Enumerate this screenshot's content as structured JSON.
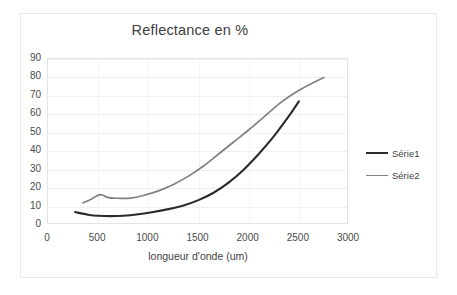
{
  "chart_data": {
    "type": "line",
    "title": "Reflectance en %",
    "xlabel": "longueur d'onde (um)",
    "ylabel": "",
    "xlim": [
      0,
      3000
    ],
    "ylim": [
      0,
      90
    ],
    "xticks": [
      "0",
      "500",
      "1000",
      "1500",
      "2000",
      "2500",
      "3000"
    ],
    "yticks": [
      "0",
      "10",
      "20",
      "30",
      "40",
      "50",
      "60",
      "70",
      "80",
      "90"
    ],
    "grid": "horizontal-and-vertical-faint",
    "legend_position": "right",
    "series": [
      {
        "name": "Série1",
        "color": "#2b2b2b",
        "x": [
          270,
          400,
          500,
          620,
          750,
          900,
          1050,
          1200,
          1350,
          1500,
          1650,
          1800,
          1950,
          2100,
          2250,
          2400,
          2500
        ],
        "y": [
          7.0,
          5.6,
          5.0,
          4.8,
          5.0,
          5.8,
          7.0,
          8.6,
          10.6,
          13.5,
          17.5,
          23.0,
          30.0,
          38.5,
          48.0,
          59.0,
          67.0
        ]
      },
      {
        "name": "Série2",
        "color": "#808080",
        "x": [
          350,
          430,
          520,
          600,
          700,
          820,
          950,
          1100,
          1250,
          1400,
          1550,
          1700,
          1850,
          2000,
          2150,
          2300,
          2400,
          2550,
          2750
        ],
        "y": [
          12.0,
          14.0,
          16.5,
          14.8,
          14.5,
          14.6,
          16.0,
          18.5,
          22.0,
          26.5,
          32.0,
          38.5,
          45.0,
          51.5,
          58.5,
          65.5,
          69.5,
          74.5,
          80.0
        ]
      }
    ]
  }
}
